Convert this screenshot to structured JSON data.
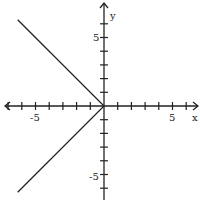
{
  "chart_data": {
    "type": "line",
    "title": "",
    "xlabel": "x",
    "ylabel": "y",
    "xlim": [
      -7.5,
      7
    ],
    "ylim": [
      -7,
      7
    ],
    "grid": false,
    "xticks": [
      -7,
      -6,
      -5,
      -4,
      -3,
      -2,
      -1,
      1,
      2,
      3,
      4,
      5,
      6
    ],
    "yticks": [
      -7,
      -6,
      -5,
      -4,
      -3,
      -2,
      -1,
      1,
      2,
      3,
      4,
      5,
      6
    ],
    "xtick_labels": [
      {
        "value": -5,
        "text": "-5"
      },
      {
        "value": 5,
        "text": "5"
      }
    ],
    "ytick_labels": [
      {
        "value": 5,
        "text": "5"
      },
      {
        "value": -5,
        "text": "-5"
      }
    ],
    "series": [
      {
        "name": "x = -|y|",
        "x": [
          -6.3,
          0,
          -6.3
        ],
        "y": [
          6.3,
          0,
          -6.3
        ],
        "color": "#222222"
      }
    ]
  },
  "axes": {
    "x_label": "x",
    "y_label": "y",
    "x_tick_5": "5",
    "x_tick_neg5": "-5",
    "y_tick_5": "5",
    "y_tick_neg5": "-5"
  }
}
